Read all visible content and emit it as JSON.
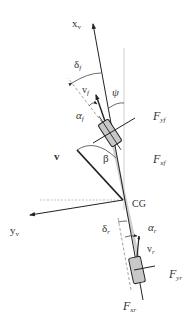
{
  "diagram": {
    "colors": {
      "line": "#222222",
      "reference": "#cccccc",
      "wheel_fill": "#c8c8c8",
      "text": "#333333"
    },
    "labels": {
      "x_axis": "x",
      "x_axis_sub": "v",
      "y_axis": "y",
      "y_axis_sub": "v",
      "delta_f": "δ",
      "delta_f_sub": "f",
      "v_f": "v",
      "v_f_sub": "f",
      "alpha_f": "α",
      "alpha_f_sub": "f",
      "psi": "ψ",
      "F_yf": "F",
      "F_yf_sub": "yf",
      "F_xf": "F",
      "F_xf_sub": "xf",
      "v": "v",
      "beta": "β",
      "cg": "CG",
      "delta_r": "δ",
      "delta_r_sub": "r",
      "alpha_r": "α",
      "alpha_r_sub": "r",
      "v_r": "v",
      "v_r_sub": "r",
      "F_yr": "F",
      "F_yr_sub": "yr",
      "F_xr": "F",
      "F_xr_sub": "xr"
    }
  }
}
